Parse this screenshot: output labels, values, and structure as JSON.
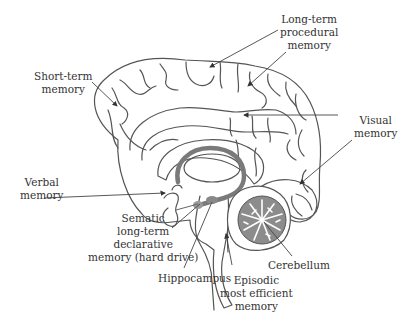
{
  "diagram": {
    "type": "anatomical brain sagittal section",
    "colors": {
      "outline": "#555555",
      "text": "#333333",
      "fornix": "#7a7a7a",
      "cerebellum_fill": "#8c8c8c",
      "background": "#ffffff"
    },
    "labels": {
      "short_term": {
        "lines": [
          "Short-term",
          "memory"
        ]
      },
      "long_term_procedural": {
        "lines": [
          "Long-term",
          "procedural",
          "memory"
        ]
      },
      "visual": {
        "lines": [
          "Visual",
          "memory"
        ]
      },
      "verbal": {
        "lines": [
          "Verbal",
          "memory"
        ]
      },
      "sematic": {
        "lines": [
          "Sematic",
          "long-term",
          "declarative",
          "memory (hard drive)"
        ]
      },
      "hippocampus": {
        "lines": [
          "Hippocampus"
        ]
      },
      "cerebellum": {
        "lines": [
          "Cerebellum"
        ]
      },
      "episodic": {
        "lines": [
          "Episodic",
          "most efficient",
          "memory"
        ]
      }
    }
  }
}
